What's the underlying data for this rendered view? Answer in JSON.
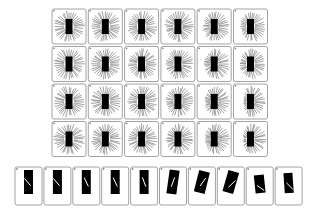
{
  "figure": {
    "background": "#ffffff",
    "panel_border_color": "#8a8a8a",
    "panel_fill": "#ffffff",
    "ray_color": "#555555",
    "bar_color": "#000000",
    "inner_line_color": "#ffffff"
  },
  "grid": {
    "rows": 4,
    "cols": 6,
    "origin_x": 52,
    "origin_y": 9,
    "panel_width": 34,
    "panel_height": 35,
    "stride_x": 36.3,
    "stride_y": 37.5,
    "bar_width": 7,
    "bar_height": 15,
    "ray_count": 36,
    "ray_inner": 5,
    "ray_outer": 15,
    "panels": [
      {
        "row": 0,
        "col": 0,
        "asym": 0.0
      },
      {
        "row": 0,
        "col": 1,
        "asym": 0.05
      },
      {
        "row": 0,
        "col": 2,
        "asym": 0.1
      },
      {
        "row": 0,
        "col": 3,
        "asym": 0.15
      },
      {
        "row": 0,
        "col": 4,
        "asym": 0.25
      },
      {
        "row": 0,
        "col": 5,
        "asym": 0.35
      },
      {
        "row": 1,
        "col": 0,
        "asym": 0.0
      },
      {
        "row": 1,
        "col": 1,
        "asym": 0.05
      },
      {
        "row": 1,
        "col": 2,
        "asym": 0.15
      },
      {
        "row": 1,
        "col": 3,
        "asym": 0.2
      },
      {
        "row": 1,
        "col": 4,
        "asym": 0.35
      },
      {
        "row": 1,
        "col": 5,
        "asym": 0.3
      },
      {
        "row": 2,
        "col": 0,
        "asym": 0.0
      },
      {
        "row": 2,
        "col": 1,
        "asym": 0.05
      },
      {
        "row": 2,
        "col": 2,
        "asym": 0.1
      },
      {
        "row": 2,
        "col": 3,
        "asym": 0.2
      },
      {
        "row": 2,
        "col": 4,
        "asym": 0.4
      },
      {
        "row": 2,
        "col": 5,
        "asym": 0.55
      },
      {
        "row": 3,
        "col": 0,
        "asym": 0.0
      },
      {
        "row": 3,
        "col": 1,
        "asym": 0.1
      },
      {
        "row": 3,
        "col": 2,
        "asym": 0.15
      },
      {
        "row": 3,
        "col": 3,
        "asym": 0.25
      },
      {
        "row": 3,
        "col": 4,
        "asym": 0.4
      },
      {
        "row": 3,
        "col": 5,
        "asym": 0.5
      }
    ]
  },
  "strip": {
    "count": 10,
    "origin_x": 15,
    "origin_y": 167,
    "panel_width": 27,
    "panel_height": 38,
    "stride_x": 28.9,
    "panels": [
      {
        "bar_w": 9,
        "bar_h": 24,
        "bar_rot": 0,
        "bar_dy": -1,
        "line_angle": -40,
        "line_len": 9,
        "line_dx": -1,
        "line_dy": 0
      },
      {
        "bar_w": 9,
        "bar_h": 24,
        "bar_rot": 0,
        "bar_dy": -1,
        "line_angle": -40,
        "line_len": 9,
        "line_dx": -1,
        "line_dy": 0
      },
      {
        "bar_w": 9,
        "bar_h": 24,
        "bar_rot": 0,
        "bar_dy": -1,
        "line_angle": -25,
        "line_len": 9,
        "line_dx": 0,
        "line_dy": 0
      },
      {
        "bar_w": 9,
        "bar_h": 24,
        "bar_rot": 0,
        "bar_dy": -1,
        "line_angle": -25,
        "line_len": 9,
        "line_dx": 0,
        "line_dy": 0
      },
      {
        "bar_w": 9,
        "bar_h": 24,
        "bar_rot": 0,
        "bar_dy": -1,
        "line_angle": -20,
        "line_len": 9,
        "line_dx": 0,
        "line_dy": 0
      },
      {
        "bar_w": 10,
        "bar_h": 24,
        "bar_rot": 8,
        "bar_dy": -1,
        "line_angle": 20,
        "line_len": 9,
        "line_dx": 0,
        "line_dy": 0
      },
      {
        "bar_w": 11,
        "bar_h": 22,
        "bar_rot": 14,
        "bar_dy": -1,
        "line_angle": 35,
        "line_len": 9,
        "line_dx": 1,
        "line_dy": 0
      },
      {
        "bar_w": 11,
        "bar_h": 22,
        "bar_rot": 16,
        "bar_dy": -1,
        "line_angle": 45,
        "line_len": 9,
        "line_dx": 1,
        "line_dy": 2
      },
      {
        "bar_w": 10,
        "bar_h": 18,
        "bar_rot": -6,
        "bar_dy": 1,
        "line_angle": -55,
        "line_len": 8,
        "line_dx": 1,
        "line_dy": 4
      },
      {
        "bar_w": 9,
        "bar_h": 20,
        "bar_rot": -4,
        "bar_dy": 0,
        "line_angle": -45,
        "line_len": 8,
        "line_dx": 1,
        "line_dy": 3
      }
    ]
  }
}
